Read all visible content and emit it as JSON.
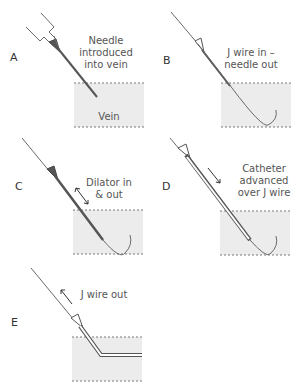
{
  "diagram": {
    "colors": {
      "vein_fill": "#ececec",
      "vein_edge": "#7a7a7a",
      "instrument": "#555555",
      "text": "#555555"
    },
    "steps": [
      {
        "letter": "A",
        "caption_lines": [
          "Needle",
          "introduced",
          "into vein"
        ],
        "vein_label": "Vein"
      },
      {
        "letter": "B",
        "caption_lines": [
          "J wire in –",
          "needle out"
        ]
      },
      {
        "letter": "C",
        "caption_lines": [
          "Dilator in",
          "& out"
        ]
      },
      {
        "letter": "D",
        "caption_lines": [
          "Catheter",
          "advanced",
          "over J wire"
        ]
      },
      {
        "letter": "E",
        "caption_lines": [
          "J wire out"
        ]
      }
    ]
  }
}
